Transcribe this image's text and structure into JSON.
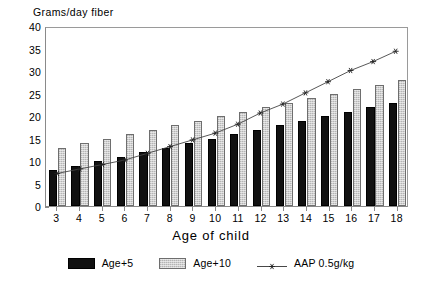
{
  "chart_data": {
    "type": "bar",
    "title": "",
    "ylabel": "Grams/day fiber",
    "xlabel": "Age of child",
    "categories": [
      "3",
      "4",
      "5",
      "6",
      "7",
      "8",
      "9",
      "10",
      "11",
      "12",
      "13",
      "14",
      "15",
      "16",
      "17",
      "18"
    ],
    "ylim": [
      0,
      40
    ],
    "yticks": [
      "0",
      "5",
      "10",
      "15",
      "20",
      "25",
      "30",
      "35",
      "40"
    ],
    "grid": false,
    "legend_position": "bottom",
    "series": [
      {
        "name": "Age+5",
        "kind": "bar",
        "color": "#111111",
        "values": [
          8,
          9,
          10,
          11,
          12,
          13,
          14,
          15,
          16,
          17,
          18,
          19,
          20,
          21,
          22,
          23
        ]
      },
      {
        "name": "Age+10",
        "kind": "bar",
        "color": "#cfcfcf",
        "values": [
          13,
          14,
          15,
          16,
          17,
          18,
          19,
          20,
          21,
          22,
          23,
          24,
          25,
          26,
          27,
          28
        ]
      },
      {
        "name": "AAP 0.5g/kg",
        "kind": "line",
        "color": "#444444",
        "marker": "star",
        "values": [
          7.5,
          8.5,
          9.5,
          10.5,
          12,
          13.5,
          15,
          16.5,
          18.5,
          21,
          23,
          25.5,
          28,
          30.5,
          32.5,
          34.8
        ]
      }
    ]
  },
  "axes": {
    "y_title": "Grams/day fiber",
    "x_title": "Age of child"
  },
  "legend": {
    "items": [
      {
        "label": "Age+5",
        "swatch": "black-bar-swatch"
      },
      {
        "label": "Age+10",
        "swatch": "gray-bar-swatch"
      },
      {
        "label": "AAP 0.5g/kg",
        "swatch": "line-star-swatch"
      }
    ]
  }
}
